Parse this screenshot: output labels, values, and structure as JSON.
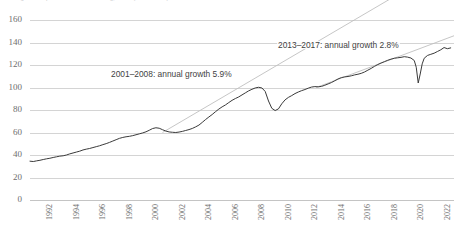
{
  "chart": {
    "title_partial": "Real gross output of US manufacturing, index (2012 = 100)"
  },
  "annotations": [
    {
      "name": "growth-annotation-2001-2008",
      "text": "2001–2008: annual growth 5.9%"
    },
    {
      "name": "growth-annotation-2013-2017",
      "text": "2013–2017: annual growth 2.8%"
    }
  ],
  "chart_data": {
    "type": "line",
    "title": "Real gross output of US manufacturing, index (2012 = 100)",
    "xlabel": "",
    "ylabel": "",
    "grid": true,
    "legend": "none",
    "xlim": [
      1991,
      2023
    ],
    "ylim": [
      0,
      160
    ],
    "ytick_labels": [
      "0",
      "20",
      "40",
      "60",
      "80",
      "100",
      "120",
      "140",
      "160"
    ],
    "ytick_values": [
      0,
      20,
      40,
      60,
      80,
      100,
      120,
      140,
      160
    ],
    "xtick_labels": [
      "1992",
      "1994",
      "1996",
      "1998",
      "2000",
      "2002",
      "2004",
      "2006",
      "2008",
      "2010",
      "2012",
      "2014",
      "2016",
      "2018",
      "2020",
      "2022"
    ],
    "xtick_values": [
      1992,
      1994,
      1996,
      1998,
      2000,
      2002,
      2004,
      2006,
      2008,
      2010,
      2012,
      2014,
      2016,
      2018,
      2020,
      2022
    ],
    "series": [
      {
        "name": "index",
        "x": [
          1991.0,
          1991.25,
          1991.5,
          1991.75,
          1992.0,
          1992.25,
          1992.5,
          1992.75,
          1993.0,
          1993.25,
          1993.5,
          1993.75,
          1994.0,
          1994.25,
          1994.5,
          1994.75,
          1995.0,
          1995.25,
          1995.5,
          1995.75,
          1996.0,
          1996.25,
          1996.5,
          1996.75,
          1997.0,
          1997.25,
          1997.5,
          1997.75,
          1998.0,
          1998.25,
          1998.5,
          1998.75,
          1999.0,
          1999.25,
          1999.5,
          1999.75,
          2000.0,
          2000.25,
          2000.5,
          2000.75,
          2001.0,
          2001.25,
          2001.5,
          2001.75,
          2002.0,
          2002.25,
          2002.5,
          2002.75,
          2003.0,
          2003.25,
          2003.5,
          2003.75,
          2004.0,
          2004.25,
          2004.5,
          2004.75,
          2005.0,
          2005.25,
          2005.5,
          2005.75,
          2006.0,
          2006.25,
          2006.5,
          2006.75,
          2007.0,
          2007.25,
          2007.5,
          2007.75,
          2008.0,
          2008.25,
          2008.5,
          2008.75,
          2009.0,
          2009.25,
          2009.5,
          2009.75,
          2010.0,
          2010.25,
          2010.5,
          2010.75,
          2011.0,
          2011.25,
          2011.5,
          2011.75,
          2012.0,
          2012.25,
          2012.5,
          2012.75,
          2013.0,
          2013.25,
          2013.5,
          2013.75,
          2014.0,
          2014.25,
          2014.5,
          2014.75,
          2015.0,
          2015.25,
          2015.5,
          2015.75,
          2016.0,
          2016.25,
          2016.5,
          2016.75,
          2017.0,
          2017.25,
          2017.5,
          2017.75,
          2018.0,
          2018.25,
          2018.5,
          2018.75,
          2019.0,
          2019.25,
          2019.5,
          2019.75,
          2020.0,
          2020.15,
          2020.3,
          2020.45,
          2020.6,
          2020.75,
          2021.0,
          2021.25,
          2021.5,
          2021.75,
          2022.0,
          2022.25,
          2022.5,
          2022.75
        ],
        "values": [
          34.5,
          34.2,
          34.8,
          35.3,
          36.0,
          36.6,
          37.1,
          37.8,
          38.4,
          39.0,
          39.3,
          40.0,
          41.0,
          41.8,
          42.6,
          43.4,
          44.5,
          45.2,
          45.8,
          46.6,
          47.4,
          48.2,
          49.2,
          50.1,
          51.2,
          52.4,
          53.6,
          54.8,
          55.6,
          56.2,
          56.6,
          57.2,
          58.0,
          58.8,
          59.6,
          60.6,
          62.0,
          63.5,
          64.2,
          63.8,
          62.5,
          61.3,
          60.5,
          60.2,
          60.0,
          60.4,
          61.0,
          61.8,
          62.6,
          63.6,
          65.0,
          66.6,
          69.0,
          71.5,
          73.8,
          76.0,
          78.5,
          80.8,
          82.8,
          84.5,
          86.6,
          88.6,
          90.2,
          91.6,
          93.4,
          95.2,
          97.0,
          98.4,
          99.6,
          100.2,
          99.6,
          96.5,
          88.0,
          81.5,
          79.5,
          81.0,
          85.5,
          89.0,
          91.2,
          92.8,
          94.6,
          96.0,
          97.2,
          98.2,
          99.4,
          100.4,
          100.8,
          100.6,
          101.0,
          102.0,
          103.2,
          104.4,
          106.0,
          107.6,
          108.8,
          109.4,
          109.8,
          110.4,
          111.2,
          111.8,
          112.6,
          113.8,
          115.4,
          117.0,
          118.8,
          120.4,
          121.8,
          123.0,
          124.2,
          125.2,
          126.0,
          126.4,
          126.8,
          127.4,
          127.0,
          126.2,
          124.0,
          118.0,
          104.0,
          112.0,
          121.0,
          126.0,
          128.5,
          129.5,
          130.5,
          132.0,
          133.5,
          135.5,
          134.5,
          135.2
        ]
      }
    ],
    "trend_lines": [
      {
        "name": "trend-2001-2008",
        "label": "2001–2008: annual growth 5.9%",
        "annual_growth_pct": 5.9,
        "x_start": 2001.0,
        "y_start": 60.0,
        "x_end": 2023.0,
        "y_end": 212.0
      },
      {
        "name": "trend-2013-2017",
        "label": "2013–2017: annual growth 2.8%",
        "annual_growth_pct": 2.8,
        "x_start": 2012.6,
        "y_start": 100.0,
        "x_end": 2023.0,
        "y_end": 146.0
      }
    ]
  }
}
